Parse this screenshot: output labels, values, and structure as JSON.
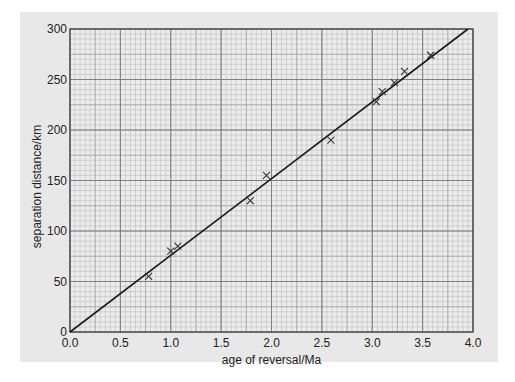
{
  "chart_data": {
    "type": "scatter",
    "title": "",
    "xlabel": "age of reversal/Ma",
    "ylabel": "separation distance/km",
    "xlim": [
      0,
      4.0
    ],
    "ylim": [
      0,
      300
    ],
    "x_ticks": [
      "0.0",
      "0.5",
      "1.0",
      "1.5",
      "2.0",
      "2.5",
      "3.0",
      "3.5",
      "4.0"
    ],
    "y_ticks": [
      "0",
      "50",
      "100",
      "150",
      "200",
      "250",
      "300"
    ],
    "grid": true,
    "grid_style": "graph paper: major every 0.5 Ma / 50 km, minor every 0.05 Ma / 5 km",
    "legend": null,
    "series": [
      {
        "name": "measured reversals",
        "marker": "x",
        "x": [
          0.78,
          1.0,
          1.07,
          1.79,
          1.95,
          2.59,
          3.04,
          3.1,
          3.22,
          3.32,
          3.58
        ],
        "y": [
          55,
          80,
          85,
          130,
          155,
          190,
          228,
          238,
          247,
          258,
          274
        ]
      },
      {
        "name": "best-fit line",
        "type": "line",
        "x": [
          0,
          3.95
        ],
        "y": [
          0,
          300
        ]
      }
    ]
  },
  "colors": {
    "panel_bg": "#e8e8e8",
    "plot_bg": "#ececec",
    "grid_minor": "#b4b4b4",
    "grid_major": "#7a7a7a",
    "line": "#1a1a1a",
    "marker": "#333333"
  }
}
